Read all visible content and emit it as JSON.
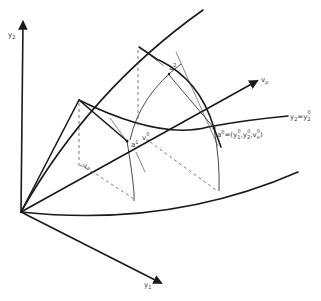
{
  "diagram": {
    "type": "geometric-coordinate-diagram",
    "labels": {
      "y2_axis": "y",
      "y2_axis_sub": "2",
      "y1_axis": "y",
      "y1_axis_sub": "1",
      "vp": "v",
      "vp_sub": "p",
      "level_curve_y": "y",
      "level_curve_y_sub": "2",
      "level_curve_eq": "=y",
      "level_curve_rhs_sub": "2",
      "level_curve_rhs_sup": "0",
      "a0": "a",
      "a0_sup": "0",
      "a0_def_eq": "=(y",
      "a0_def_y1_sub": "1",
      "a0_def_y1_sup": "0",
      "a0_def_comma1": ",y",
      "a0_def_y2_sub": "2",
      "a0_def_y2_sup": "0",
      "a0_def_comma2": ",v",
      "a0_def_ve_sub": "e",
      "a0_def_ve_sup": "0",
      "a0_def_close": ")",
      "a1": "a",
      "a1_sup": "1",
      "a2": "a",
      "a2_sup": "2",
      "ve0": "v",
      "ve0_sub": "e",
      "ve0_sup": "0",
      "ve": "v",
      "ve_sub": "e"
    },
    "colors": {
      "stroke": "#1a1a1a",
      "text": "#333333",
      "dashed": "#555555",
      "background": "#ffffff"
    }
  }
}
